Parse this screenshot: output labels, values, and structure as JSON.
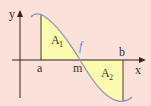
{
  "diagram": {
    "title": "",
    "axes": {
      "x_label": "x",
      "y_label": "y"
    },
    "points": {
      "a": "a",
      "m": "m",
      "b": "b"
    },
    "function_label": "f",
    "regions": [
      {
        "label": "A",
        "subscript": "1"
      },
      {
        "label": "A",
        "subscript": "2"
      }
    ],
    "colors": {
      "background": "#fbe1d9",
      "region_fill": "#fdfbb0",
      "curve": "#8d9bb4",
      "axis": "#2e2424",
      "function_label": "#6f87c8"
    }
  }
}
